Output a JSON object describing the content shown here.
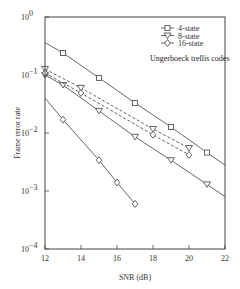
{
  "chart_data": {
    "type": "line",
    "title": "",
    "xlabel": "SNR (dB)",
    "ylabel": "Frame error rate",
    "xscale": "linear",
    "yscale": "log",
    "xlim": [
      12,
      22
    ],
    "ylim": [
      0.0001,
      1
    ],
    "xticks": [
      12,
      14,
      16,
      18,
      20,
      22
    ],
    "xtick_labels": [
      "12",
      "14",
      "16",
      "18",
      "20",
      "22"
    ],
    "yticks": [
      1,
      0.1,
      0.01,
      0.001,
      0.0001
    ],
    "ytick_labels": [
      {
        "base": "10",
        "exp": "0"
      },
      {
        "base": "10",
        "exp": "−1"
      },
      {
        "base": "10",
        "exp": "−2"
      },
      {
        "base": "10",
        "exp": "−3"
      },
      {
        "base": "10",
        "exp": "−4"
      }
    ],
    "grid": false,
    "legend_position": "upper right",
    "annotation": "Ungerboeck trellis codes",
    "series": [
      {
        "name": "4-state",
        "marker": "square",
        "style": "solid",
        "x": [
          12,
          13,
          15,
          17,
          19,
          21,
          22
        ],
        "values": [
          0.36,
          0.24,
          0.089,
          0.033,
          0.0127,
          0.0046,
          0.0028
        ],
        "marker_x": [
          13,
          15,
          17,
          19,
          21
        ]
      },
      {
        "name": "8-state",
        "marker": "triangle-down",
        "style": "solid",
        "x": [
          12,
          13,
          15,
          17,
          19,
          21,
          22
        ],
        "values": [
          0.1,
          0.067,
          0.024,
          0.0086,
          0.0034,
          0.0013,
          0.0008
        ],
        "marker_x": [
          12,
          13,
          15,
          17,
          19,
          21
        ]
      },
      {
        "name": "16-state",
        "marker": "diamond",
        "style": "solid",
        "x": [
          12,
          13,
          15,
          16,
          17
        ],
        "values": [
          0.04,
          0.017,
          0.0034,
          0.0014,
          0.0006
        ],
        "marker_x": [
          13,
          15,
          16,
          17
        ]
      },
      {
        "name": "8-state (dashed)",
        "marker": "triangle-down",
        "style": "dashed",
        "x": [
          12,
          14,
          18,
          20
        ],
        "values": [
          0.127,
          0.06,
          0.0117,
          0.0055
        ],
        "marker_x": [
          12,
          14,
          18,
          20
        ]
      },
      {
        "name": "16-state (dashed)",
        "marker": "diamond",
        "style": "dashed",
        "x": [
          12,
          14,
          18,
          20
        ],
        "values": [
          0.108,
          0.049,
          0.0093,
          0.0042
        ],
        "marker_x": [
          12,
          14,
          18,
          20
        ]
      }
    ]
  },
  "legend": {
    "items": [
      {
        "label": "4-state",
        "marker": "square"
      },
      {
        "label": "8-state",
        "marker": "triangle-down"
      },
      {
        "label": "16-state",
        "marker": "diamond"
      }
    ]
  },
  "colors": {
    "line": "#555555",
    "axis": "#444444",
    "text": "#333333"
  }
}
